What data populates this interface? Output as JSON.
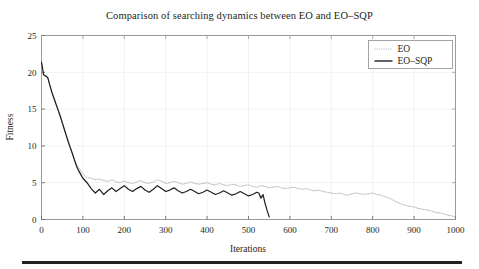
{
  "chart_data": {
    "type": "line",
    "title": "Comparison of searching dynamics between EO and EO–SQP",
    "xlabel": "Iterations",
    "ylabel": "Fitness",
    "xlim": [
      0,
      1000
    ],
    "ylim": [
      0,
      25
    ],
    "xticks": [
      0,
      100,
      200,
      300,
      400,
      500,
      600,
      700,
      800,
      900,
      1000
    ],
    "yticks": [
      0,
      5,
      10,
      15,
      20,
      25
    ],
    "xtick_labels": [
      "0",
      "100",
      "200",
      "300",
      "400",
      "500",
      "600",
      "700",
      "800",
      "900",
      "1000"
    ],
    "ytick_labels": [
      "0",
      "5",
      "10",
      "15",
      "20",
      "25"
    ],
    "grid": true,
    "legend_position": "top-right",
    "series": [
      {
        "name": "EO",
        "style": "dotted",
        "color": "#a8a8a8",
        "x": [
          0,
          5,
          10,
          15,
          20,
          25,
          30,
          35,
          40,
          45,
          50,
          55,
          60,
          65,
          70,
          75,
          80,
          85,
          90,
          95,
          100,
          110,
          120,
          130,
          140,
          150,
          160,
          170,
          180,
          190,
          200,
          210,
          220,
          230,
          240,
          250,
          260,
          270,
          280,
          290,
          300,
          310,
          320,
          330,
          340,
          350,
          360,
          370,
          380,
          390,
          400,
          410,
          420,
          430,
          440,
          450,
          460,
          470,
          480,
          490,
          500,
          510,
          520,
          530,
          540,
          550,
          560,
          570,
          580,
          590,
          600,
          610,
          620,
          630,
          640,
          650,
          660,
          670,
          680,
          690,
          700,
          710,
          720,
          730,
          740,
          750,
          760,
          770,
          780,
          790,
          800,
          810,
          820,
          830,
          840,
          850,
          860,
          870,
          880,
          890,
          900,
          910,
          920,
          930,
          940,
          950,
          960,
          970,
          980,
          990,
          1000
        ],
        "y": [
          20.3,
          19.6,
          19.4,
          19.2,
          18.2,
          17.2,
          16.4,
          15.6,
          14.8,
          14.0,
          13.1,
          12.2,
          11.3,
          10.4,
          9.6,
          8.8,
          8.1,
          7.5,
          7.0,
          6.6,
          6.2,
          5.7,
          5.6,
          5.4,
          5.5,
          5.3,
          5.2,
          5.4,
          5.1,
          5.0,
          5.2,
          5.0,
          4.9,
          5.1,
          5.3,
          5.0,
          4.9,
          5.1,
          5.4,
          5.2,
          4.9,
          5.0,
          5.2,
          5.0,
          4.8,
          4.9,
          5.1,
          4.9,
          4.8,
          4.9,
          5.0,
          4.8,
          4.7,
          4.9,
          4.7,
          4.6,
          4.8,
          4.7,
          4.5,
          4.6,
          4.7,
          4.5,
          4.4,
          4.6,
          4.5,
          4.3,
          4.4,
          4.5,
          4.3,
          4.2,
          4.3,
          4.4,
          4.2,
          4.1,
          4.2,
          4.0,
          3.9,
          4.0,
          3.8,
          3.7,
          3.6,
          3.5,
          3.6,
          3.4,
          3.3,
          3.5,
          3.6,
          3.5,
          3.4,
          3.5,
          3.6,
          3.4,
          3.3,
          3.1,
          2.9,
          2.6,
          2.3,
          2.1,
          1.9,
          1.8,
          1.7,
          1.5,
          1.4,
          1.3,
          1.2,
          1.0,
          0.9,
          0.8,
          0.6,
          0.5,
          0.35
        ]
      },
      {
        "name": "EO–SQP",
        "style": "solid",
        "color": "#231f20",
        "x": [
          0,
          5,
          10,
          15,
          20,
          25,
          30,
          35,
          40,
          45,
          50,
          55,
          60,
          65,
          70,
          75,
          80,
          85,
          90,
          95,
          100,
          110,
          120,
          130,
          140,
          150,
          160,
          170,
          180,
          190,
          200,
          210,
          220,
          230,
          240,
          250,
          260,
          270,
          280,
          290,
          300,
          310,
          320,
          330,
          340,
          350,
          360,
          370,
          380,
          390,
          400,
          410,
          420,
          430,
          440,
          450,
          460,
          470,
          480,
          490,
          500,
          510,
          520,
          525,
          530,
          535,
          540,
          545,
          550
        ],
        "y": [
          21.4,
          19.7,
          19.5,
          19.3,
          18.3,
          17.3,
          16.5,
          15.7,
          14.9,
          14.1,
          13.2,
          12.3,
          11.4,
          10.5,
          9.7,
          8.9,
          8.0,
          7.2,
          6.6,
          6.1,
          5.6,
          5.0,
          4.2,
          3.6,
          4.1,
          3.4,
          3.9,
          4.3,
          3.8,
          4.2,
          4.6,
          4.1,
          3.8,
          4.2,
          4.5,
          4.0,
          3.7,
          4.1,
          4.6,
          4.2,
          3.8,
          4.0,
          4.3,
          3.9,
          3.6,
          3.8,
          4.1,
          3.8,
          3.5,
          3.7,
          4.0,
          3.7,
          3.4,
          3.6,
          3.9,
          3.6,
          3.3,
          3.5,
          3.8,
          3.5,
          3.2,
          3.4,
          3.7,
          3.6,
          2.9,
          3.4,
          2.2,
          1.2,
          0.35
        ]
      }
    ]
  },
  "legend": {
    "entries": [
      {
        "label": "EO",
        "marker": "dotted-line"
      },
      {
        "label": "EO–SQP",
        "marker": "solid-line"
      }
    ]
  }
}
